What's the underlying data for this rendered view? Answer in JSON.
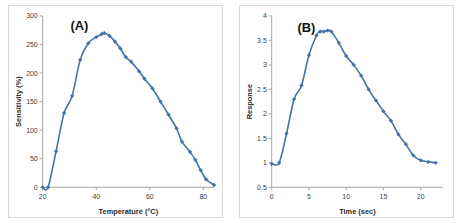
{
  "figure": {
    "background": "#ffffff",
    "series_color": "#4472a8",
    "axis_color": "#a6a6a6"
  },
  "panels": [
    {
      "label": "(A)",
      "name": "panel-a"
    },
    {
      "label": "(B)",
      "name": "panel-b"
    }
  ],
  "chart_data": [
    {
      "type": "line",
      "title": "(A)",
      "xlabel": "Temperature (°C)",
      "ylabel": "Sensitivity (%)",
      "xlim": [
        20,
        84
      ],
      "ylim": [
        0,
        300
      ],
      "xticks": [
        20,
        40,
        60,
        80
      ],
      "xticklabels": [
        "20",
        "40",
        "60",
        "80"
      ],
      "yticks": [
        0,
        50,
        100,
        150,
        200,
        250,
        300
      ],
      "yticklabels": [
        "0",
        "50",
        "100",
        "150",
        "200",
        "250",
        "300"
      ],
      "grid": false,
      "legend": "none",
      "marker": "diamond",
      "color": "#4472a8",
      "x": [
        20,
        22,
        25,
        28,
        31,
        34,
        37,
        40,
        42,
        43,
        45,
        47,
        49,
        51,
        53,
        56,
        58,
        61,
        64,
        67,
        70,
        72,
        75,
        77,
        79,
        81,
        84
      ],
      "values": [
        0,
        0,
        63,
        130,
        160,
        223,
        252,
        263,
        268,
        270,
        265,
        255,
        243,
        228,
        220,
        203,
        190,
        173,
        150,
        127,
        103,
        80,
        62,
        48,
        30,
        14,
        4
      ]
    },
    {
      "type": "line",
      "title": "(B)",
      "xlabel": "Time (sec)",
      "ylabel": "Response",
      "xlim": [
        0,
        23
      ],
      "ylim": [
        0.5,
        4
      ],
      "xticks": [
        0,
        5,
        10,
        15,
        20
      ],
      "xticklabels": [
        "0",
        "5",
        "10",
        "15",
        "20"
      ],
      "yticks": [
        0.5,
        1,
        1.5,
        2,
        2.5,
        3,
        3.5,
        4
      ],
      "yticklabels": [
        "0.5",
        "1",
        "1.5",
        "2",
        "2.5",
        "3",
        "3.5",
        "4"
      ],
      "grid": false,
      "legend": "none",
      "marker": "diamond",
      "color": "#4472a8",
      "x": [
        0,
        1,
        2,
        3,
        4,
        5,
        6,
        6.5,
        7,
        7.5,
        8,
        9,
        10,
        11,
        12,
        13,
        14,
        15,
        16,
        17,
        18,
        19,
        20,
        21,
        22
      ],
      "values": [
        0.98,
        1.0,
        1.6,
        2.3,
        2.58,
        3.2,
        3.6,
        3.68,
        3.68,
        3.7,
        3.68,
        3.45,
        3.18,
        3.0,
        2.78,
        2.5,
        2.27,
        2.05,
        1.86,
        1.58,
        1.38,
        1.15,
        1.05,
        1.02,
        1.0
      ]
    }
  ]
}
